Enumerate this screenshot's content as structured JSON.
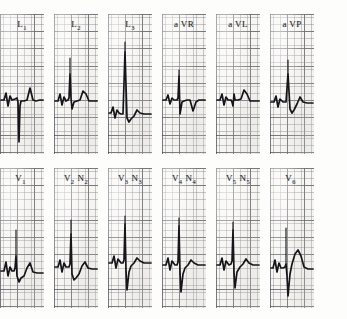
{
  "document": {
    "type": "12-lead electrocardiogram",
    "appearance": "scanned grid paper strips"
  },
  "rows": [
    {
      "name": "limb-leads",
      "panels": [
        {
          "lead": "L",
          "sub": "1",
          "annotation": "",
          "annotation_sub": ""
        },
        {
          "lead": "L",
          "sub": "2",
          "annotation": "",
          "annotation_sub": ""
        },
        {
          "lead": "L",
          "sub": "3",
          "annotation": "",
          "annotation_sub": ""
        },
        {
          "lead": "a VR",
          "sub": "",
          "annotation": "",
          "annotation_sub": ""
        },
        {
          "lead": "a VL",
          "sub": "",
          "annotation": "",
          "annotation_sub": ""
        },
        {
          "lead": "a VP",
          "sub": "",
          "annotation": "",
          "annotation_sub": ""
        }
      ]
    },
    {
      "name": "precordial-leads",
      "panels": [
        {
          "lead": "V",
          "sub": "1",
          "annotation": "",
          "annotation_sub": ""
        },
        {
          "lead": "V",
          "sub": "2",
          "annotation": "N",
          "annotation_sub": "2"
        },
        {
          "lead": "V",
          "sub": "3",
          "annotation": "N",
          "annotation_sub": "3"
        },
        {
          "lead": "V",
          "sub": "4",
          "annotation": "N",
          "annotation_sub": "4"
        },
        {
          "lead": "V",
          "sub": "5",
          "annotation": "N",
          "annotation_sub": "5"
        },
        {
          "lead": "V",
          "sub": "6",
          "annotation": "",
          "annotation_sub": ""
        }
      ]
    }
  ],
  "chart_data": {
    "type": "line",
    "xlabel": "time",
    "ylabel": "amplitude",
    "grid": true,
    "legend": "none",
    "paper_color": "#f7f6f3",
    "trace_color": "#16161a",
    "grid_minor_color": "#78788040",
    "grid_major_color": "#464650b8",
    "panel_width_px": 44,
    "panel_height_px": 140,
    "series": [
      {
        "name": "L1",
        "baseline_y": 86,
        "path": "M1,86 L4,86 L6,79 L8,92 L10,82 L12,86 L15,85 L17,84 L18,88 L19,128 L20,92 L21,87 L24,87 L27,86 L30,74 L33,86 L36,87 L40,86 L43,86",
        "spike": ""
      },
      {
        "name": "L2",
        "baseline_y": 86,
        "path": "M1,87 L4,87 L6,80 L8,91 L10,83 L12,87 L14,86 L15,84 L16,60 L17,84 L18,95 L20,88 L23,87 L26,86 L29,77 L32,80 L35,87 L38,87 L43,87",
        "spike": "M16,60 L16,44"
      },
      {
        "name": "L3",
        "baseline_y": 100,
        "path": "M1,99 L3,99 L5,93 L7,104 L9,96 L11,99 L13,100 L15,100 L17,38 L19,104 L21,108 L23,105 L26,102 L29,96 L32,99 L36,100 L40,100 L43,100",
        "spike": "M17,38 L17,28"
      },
      {
        "name": "aVR",
        "baseline_y": 86,
        "path": "M1,86 L4,86 L6,81 L8,90 L10,84 L12,86 L15,86 L16,84 L17,62 L18,100 L20,88 L22,87 L25,86 L28,86 L31,97 L34,88 L37,86 L40,86 L43,86",
        "spike": "M17,62 L17,56"
      },
      {
        "name": "aVL",
        "baseline_y": 86,
        "path": "M1,86 L4,86 L6,80 L8,91 L10,83 L12,86 L15,86 L16,88 L17,92 L18,80 L19,86 L22,86 L25,85 L28,76 L31,80 L34,87 L38,87 L43,87",
        "spike": ""
      },
      {
        "name": "aVP",
        "baseline_y": 88,
        "path": "M1,88 L4,88 L6,82 L8,93 L10,85 L13,88 L16,88 L18,60 L20,95 L22,99 L24,96 L27,90 L30,83 L33,88 L37,89 L41,89 L43,89",
        "spike": "M18,60 L18,46"
      },
      {
        "name": "V1",
        "baseline_y": 102,
        "path": "M1,103 L4,103 L6,94 L8,108 L10,99 L12,103 L14,103 L15,100 L16,88 L17,108 L19,114 L21,110 L24,108 L27,100 L30,95 L33,104 L37,105 L41,105 L43,105",
        "spike": "M16,88 L16,62"
      },
      {
        "name": "V2",
        "baseline_y": 98,
        "path": "M1,99 L4,99 L6,92 L8,104 L10,95 L12,99 L15,99 L16,96 L17,66 L18,106 L20,112 L22,110 L25,106 L28,98 L31,94 L34,100 L38,101 L43,101",
        "spike": "M17,66 L17,52"
      },
      {
        "name": "V3",
        "baseline_y": 94,
        "path": "M1,95 L4,95 L6,88 L8,100 L10,91 L13,95 L15,95 L16,92 L17,56 L18,102 L19,122 L21,104 L23,98 L26,95 L29,90 L32,93 L36,95 L40,95 L43,95",
        "spike": "M17,56 L17,48"
      },
      {
        "name": "V4",
        "baseline_y": 96,
        "path": "M1,97 L4,97 L6,90 L8,102 L10,93 L13,97 L15,97 L16,94 L17,58 L18,104 L19,124 L21,106 L23,100 L26,97 L29,92 L32,95 L36,97 L40,97 L43,97",
        "spike": "M17,58 L17,50"
      },
      {
        "name": "V5",
        "baseline_y": 96,
        "path": "M1,97 L4,97 L6,90 L8,102 L10,93 L13,97 L15,96 L16,93 L17,62 L18,104 L19,120 L21,104 L24,99 L27,96 L30,91 L33,95 L37,97 L41,97 L43,97",
        "spike": "M17,62 L17,54"
      },
      {
        "name": "V6",
        "baseline_y": 100,
        "path": "M1,100 L3,100 L5,92 L7,104 L9,95 L11,100 L13,100 L15,99 L16,96 L17,108 L18,128 L20,106 L22,96 L25,86 L28,82 L31,88 L34,99 L38,101 L43,101",
        "spike": "M16,96 L16,60"
      }
    ]
  }
}
